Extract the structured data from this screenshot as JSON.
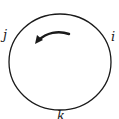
{
  "diagram": {
    "type": "cycle",
    "labels": {
      "i": "i",
      "j": "j",
      "k": "k"
    },
    "arrow_direction": "counter-clockwise",
    "stroke_color": "#1a1a1a",
    "background": "#ffffff"
  }
}
